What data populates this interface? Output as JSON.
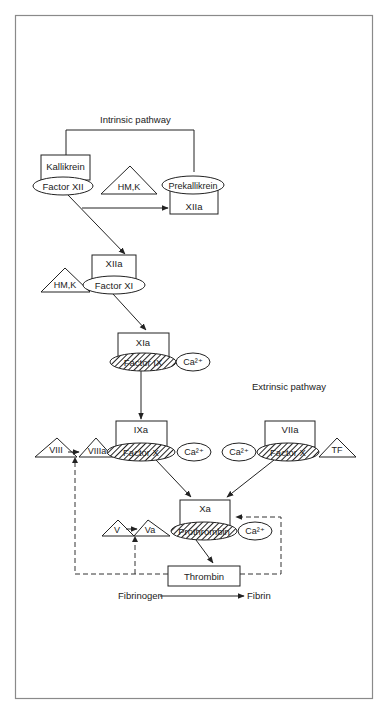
{
  "diagram": {
    "type": "coagulation-cascade",
    "sections": {
      "intrinsic_title": "Intrinsic pathway",
      "extrinsic_title": "Extrinsic pathway"
    },
    "nodes": {
      "kallikrein": "Kallikrein",
      "factor_xii": "Factor XII",
      "hmk_1": "HM,K",
      "prekallikrein": "Prekallikrein",
      "xiia_1": "XIIa",
      "xiia_2": "XIIa",
      "hmk_2": "HM,K",
      "factor_xi": "Factor XI",
      "xia": "XIa",
      "factor_ix": "Factor IX",
      "ca_1": "Ca²⁺",
      "ixa": "IXa",
      "viii": "VIII",
      "viiia": "VIIIa",
      "factor_x_intrinsic": "Factor X",
      "ca_2": "Ca²⁺",
      "ca_3": "Ca²⁺",
      "viia": "VIIa",
      "factor_x_extrinsic": "Factor X",
      "tf": "TF",
      "xa": "Xa",
      "v": "V",
      "va": "Va",
      "prothrombin": "Prothrombin",
      "ca_4": "Ca²⁺",
      "thrombin": "Thrombin",
      "fibrinogen": "Fibrinogen",
      "fibrin": "Fibrin"
    },
    "edges": [
      {
        "from": "Factor XII",
        "to": "XIIa (Prekallikrein)",
        "style": "solid"
      },
      {
        "from": "Factor XII",
        "to": "XIIa (Factor XI)",
        "style": "solid"
      },
      {
        "from": "Factor XI",
        "to": "XIa",
        "style": "solid"
      },
      {
        "from": "Factor IX",
        "to": "IXa",
        "style": "solid"
      },
      {
        "from": "Factor X (intrinsic)",
        "to": "Xa",
        "style": "solid"
      },
      {
        "from": "Factor X (extrinsic)",
        "to": "Xa",
        "style": "solid"
      },
      {
        "from": "Prothrombin",
        "to": "Thrombin",
        "style": "solid"
      },
      {
        "from": "VIII",
        "to": "VIIIa",
        "style": "solid"
      },
      {
        "from": "V",
        "to": "Va",
        "style": "solid"
      },
      {
        "from": "Thrombin",
        "to": "VIIIa",
        "style": "dashed"
      },
      {
        "from": "Thrombin",
        "to": "Va",
        "style": "dashed"
      },
      {
        "from": "Thrombin",
        "to": "Xa/Prothrombin",
        "style": "dashed"
      },
      {
        "from": "Fibrinogen",
        "to": "Fibrin",
        "style": "solid"
      },
      {
        "from": "Kallikrein",
        "to": "Prekallikrein",
        "style": "solid-loop"
      }
    ]
  }
}
